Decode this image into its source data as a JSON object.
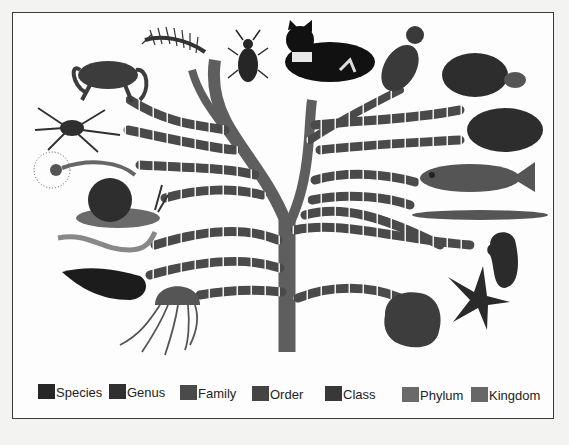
{
  "figure": {
    "type": "taxonomy-tree-illustration"
  },
  "legend": {
    "items": [
      {
        "label": "Species",
        "color": "#262626",
        "x": 0,
        "y": 0
      },
      {
        "label": "Genus",
        "color": "#303030",
        "x": 71,
        "y": 0
      },
      {
        "label": "Family",
        "color": "#4a4a4a",
        "x": 142,
        "y": 1
      },
      {
        "label": "Order",
        "color": "#444444",
        "x": 214,
        "y": 2
      },
      {
        "label": "Class",
        "color": "#383838",
        "x": 287,
        "y": 2
      },
      {
        "label": "Phylum",
        "color": "#6a6a6a",
        "x": 364,
        "y": 3
      },
      {
        "label": "Kingdom",
        "color": "#676767",
        "x": 433,
        "y": 3
      }
    ]
  },
  "animals": {
    "left": [
      "centipede",
      "beetle",
      "crab",
      "spider",
      "fan-worm",
      "snail",
      "bristle-worm",
      "leech",
      "jellyfish"
    ],
    "top": [
      "cat",
      "bird"
    ],
    "right": [
      "tortoise",
      "frog",
      "fish",
      "lancelet",
      "sea-squirt",
      "starfish",
      "sponge"
    ]
  },
  "colors": {
    "trunk": "#5e5e5e",
    "frame_border": "#3a3a3a",
    "background": "#fdfdfd"
  }
}
